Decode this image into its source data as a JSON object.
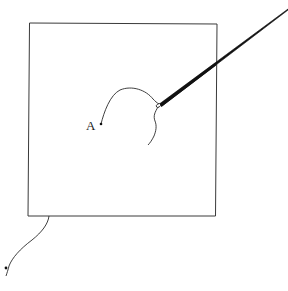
{
  "figure": {
    "point_label": "A",
    "colors": {
      "stroke": "#2a2a2a",
      "rod": "#111111",
      "background": "#ffffff"
    },
    "square": {
      "x": 29,
      "y": 23,
      "width": 187,
      "height": 193
    },
    "caption_visible": "",
    "caption_note": "bottom caption text is cropped at image edge; only ascenders visible"
  }
}
